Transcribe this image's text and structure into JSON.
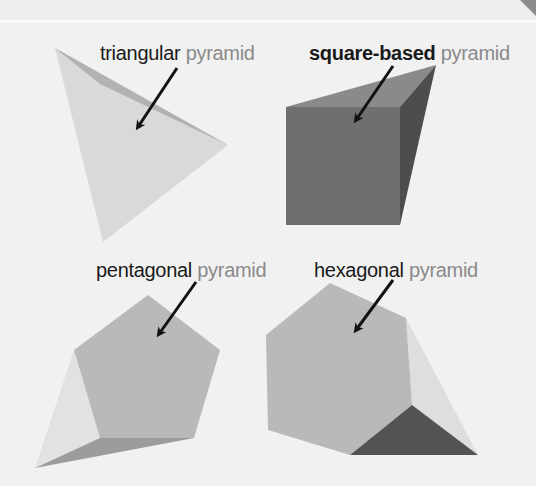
{
  "figure": {
    "colors": {
      "background": "#f1f1f1",
      "label_primary": "#1a1a1a",
      "label_secondary": "#8a8a8a",
      "arrow": "#111111",
      "face_light": "#d6d6d6",
      "face_mid": "#b4b4b4",
      "face_dark": "#6e6e6e",
      "face_darker": "#4f4f4f"
    },
    "pyramids": [
      {
        "id": "triangular",
        "kind": "triangular",
        "noun": "pyramid",
        "base": "triangle",
        "kind_bold": false
      },
      {
        "id": "square",
        "kind": "square-based",
        "noun": "pyramid",
        "base": "square",
        "kind_bold": true
      },
      {
        "id": "pentagonal",
        "kind": "pentagonal",
        "noun": "pyramid",
        "base": "pentagon",
        "kind_bold": false
      },
      {
        "id": "hexagonal",
        "kind": "hexagonal",
        "noun": "pyramid",
        "base": "hexagon",
        "kind_bold": false
      }
    ]
  }
}
